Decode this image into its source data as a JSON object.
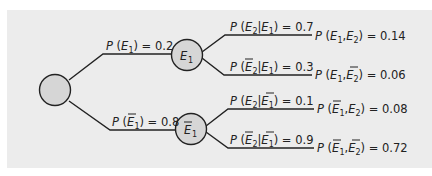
{
  "diagram": {
    "type": "probability-tree",
    "colors": {
      "background": "#ececec",
      "line": "#222222",
      "node_fill": "#d6d6d6",
      "text": "#222222"
    },
    "root": {
      "label": ""
    },
    "level1": [
      {
        "node_label": "E1",
        "node_bar": false,
        "edge_label": "P (E1) = 0.2",
        "probability": 0.2
      },
      {
        "node_label": "Ē1",
        "node_bar": true,
        "edge_label": "P (Ē1) = 0.8",
        "probability": 0.8
      }
    ],
    "level2": [
      {
        "parent": "E1",
        "edge_label": "P (E2|E1) = 0.7",
        "probability": 0.7,
        "joint_label": "P (E1,E2) = 0.14",
        "joint": 0.14
      },
      {
        "parent": "E1",
        "edge_label": "P (Ē2|E1) = 0.3",
        "probability": 0.3,
        "joint_label": "P (E1,Ē2) = 0.06",
        "joint": 0.06
      },
      {
        "parent": "Ē1",
        "edge_label": "P (E2|Ē1) = 0.1",
        "probability": 0.1,
        "joint_label": "P (Ē1,E2) = 0.08",
        "joint": 0.08
      },
      {
        "parent": "Ē1",
        "edge_label": "P (Ē2|Ē1) = 0.9",
        "probability": 0.9,
        "joint_label": "P (Ē1,Ē2) = 0.72",
        "joint": 0.72
      }
    ],
    "values": {
      "p_e1": "0.2",
      "p_not_e1": "0.8",
      "p_e2_given_e1": "0.7",
      "p_not_e2_given_e1": "0.3",
      "p_e2_given_not_e1": "0.1",
      "p_not_e2_given_not_e1": "0.9",
      "j_e1_e2": "0.14",
      "j_e1_not_e2": "0.06",
      "j_not_e1_e2": "0.08",
      "j_not_e1_not_e2": "0.72"
    }
  }
}
